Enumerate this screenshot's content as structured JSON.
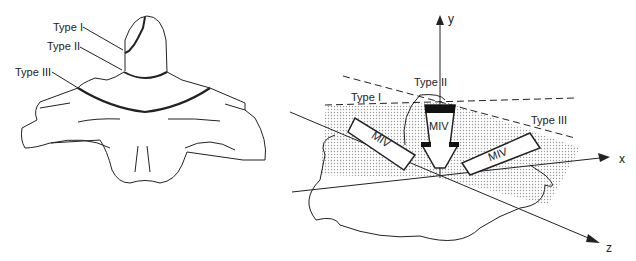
{
  "left_figure": {
    "labels": {
      "type1": "Type I",
      "type2": "Type II",
      "type3": "Type III"
    }
  },
  "right_figure": {
    "labels": {
      "type1": "Type I",
      "type2": "Type II",
      "type3": "Type III"
    },
    "arrows": {
      "left": "MIV",
      "center": "MIV",
      "right": "MIV"
    },
    "axes": {
      "x": "x",
      "y": "y",
      "z": "z"
    }
  }
}
